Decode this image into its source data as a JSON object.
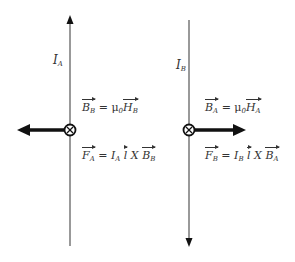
{
  "wire_a": {
    "current_label": "I",
    "current_sub": "A",
    "current_direction": "up",
    "field_eq": {
      "lhs": "B",
      "lhs_sub": "B",
      "op": " = μ",
      "mu_sub": "0",
      "rhs": "H",
      "rhs_sub": "B"
    },
    "force_eq": {
      "lhs": "F",
      "lhs_sub": "A",
      "op": " = ",
      "i": "I",
      "i_sub": "A",
      "l": "l",
      "cross": " X ",
      "b": "B",
      "b_sub": "B"
    },
    "field_symbol": "into-page",
    "force_direction": "left"
  },
  "wire_b": {
    "current_label": "I",
    "current_sub": "B",
    "current_direction": "down",
    "field_eq": {
      "lhs": "B",
      "lhs_sub": "A",
      "op": " = μ",
      "mu_sub": "0",
      "rhs": "H",
      "rhs_sub": "A"
    },
    "force_eq": {
      "lhs": "F",
      "lhs_sub": "B",
      "op": " = ",
      "i": "I",
      "i_sub": "B",
      "l": "l",
      "cross": " X ",
      "b": "B",
      "b_sub": "A"
    },
    "field_symbol": "into-page",
    "force_direction": "right"
  }
}
